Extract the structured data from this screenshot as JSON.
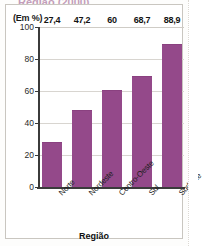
{
  "figure": {
    "unit_label": "(Em %)",
    "cropped_title_fragment": "Região (2000)"
  },
  "chart_data": {
    "type": "bar",
    "title": "",
    "xlabel": "Região",
    "ylabel": "(Em %)",
    "categories": [
      "Norte",
      "Nordeste",
      "Centro-Oeste",
      "Sul",
      "Sudeste"
    ],
    "values": [
      27.4,
      60.0,
      47.2,
      68.7,
      88.9
    ],
    "value_labels": [
      "27,4",
      "47,2",
      "60",
      "68,7",
      "88,9"
    ],
    "series": [
      {
        "name": "",
        "values": [
          27.4,
          47.2,
          60.0,
          68.7,
          88.9
        ]
      }
    ],
    "ylim": [
      0,
      100
    ],
    "yticks": [
      0,
      20,
      40,
      60,
      80,
      100
    ],
    "ytick_labels": [
      "0",
      "20",
      "40",
      "60",
      "80",
      "100"
    ],
    "grid": true,
    "grid_axis": "y",
    "legend": false,
    "bar_color": "#94498a",
    "axis_color": "#3b3b3b",
    "gridline_color": "#d8d5d0",
    "xtick_label_rotation": -45
  }
}
